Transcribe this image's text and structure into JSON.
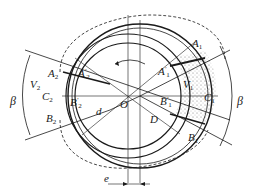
{
  "diagram": {
    "type": "vane pump / rotor-stator schematic",
    "labels": {
      "A1": "A",
      "A1_sub": "1",
      "A1p": "A",
      "A1p_sub": "1",
      "A1p_sup": "′",
      "A2": "A",
      "A2_sub": "2",
      "A2p": "A",
      "A2p_sub": "2",
      "A2p_sup": "′",
      "B1": "B",
      "B1_sub": "1",
      "B1p": "B",
      "B1p_sub": "1",
      "B1p_sup": "′",
      "B2": "B",
      "B2_sub": "2",
      "B2p": "B",
      "B2p_sub": "2",
      "B2p_sup": "′",
      "C1": "C",
      "C1_sub": "1",
      "C2": "C",
      "C2_sub": "2",
      "V1": "V",
      "V1_sub": "1",
      "V2": "V",
      "V2_sub": "2",
      "O": "O",
      "d": "d",
      "D": "D",
      "e": "e",
      "beta_left": "β",
      "beta_right": "β"
    },
    "colors": {
      "line": "#1a1a1a",
      "background": "#ffffff",
      "stipple": "#555555"
    }
  }
}
